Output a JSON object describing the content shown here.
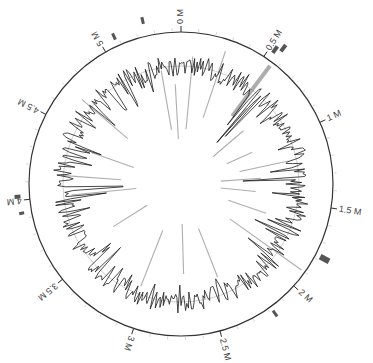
{
  "figure": {
    "type": "circular-genome-map",
    "genome_size_mb": 5.45,
    "center": [
      181,
      184
    ],
    "radius": 152,
    "colors": {
      "ring": "#333333",
      "trace": "#1a1a1a",
      "inner_lines": "#9a9a9a",
      "markers": "#555555",
      "highlight": "#999999"
    }
  },
  "axis": {
    "tick_labels": [
      {
        "pos": 0.0,
        "label": "0 M"
      },
      {
        "pos": 0.5,
        "label": "0.5 M"
      },
      {
        "pos": 1.0,
        "label": "1 M"
      },
      {
        "pos": 1.5,
        "label": "1.5 M"
      },
      {
        "pos": 2.0,
        "label": "2 M"
      },
      {
        "pos": 2.5,
        "label": "2.5 M"
      },
      {
        "pos": 3.0,
        "label": "3 M"
      },
      {
        "pos": 3.5,
        "label": "3.5 M"
      },
      {
        "pos": 4.0,
        "label": "4 M"
      },
      {
        "pos": 4.5,
        "label": "4.5 M"
      },
      {
        "pos": 5.0,
        "label": "5 M"
      }
    ],
    "minor_tick_step_mb": 0.1
  },
  "outer_markers": [
    {
      "pos": 0.53,
      "rOffset": 12,
      "size": [
        4,
        8
      ]
    },
    {
      "pos": 0.56,
      "rOffset": 18,
      "size": [
        4,
        8
      ]
    },
    {
      "pos": 1.78,
      "rOffset": 10,
      "size": [
        6,
        10
      ]
    },
    {
      "pos": 2.18,
      "rOffset": 8,
      "size": [
        3,
        7
      ]
    },
    {
      "pos": 3.93,
      "rOffset": 10,
      "size": [
        3,
        5
      ]
    },
    {
      "pos": 4.02,
      "rOffset": 12,
      "size": [
        4,
        6
      ]
    },
    {
      "pos": 5.08,
      "rOffset": 10,
      "size": [
        3,
        7
      ]
    },
    {
      "pos": 5.25,
      "rOffset": 16,
      "size": [
        3,
        7
      ]
    }
  ],
  "highlight_band": {
    "pos": 0.56,
    "r1": 85,
    "r2": 148,
    "width": 4
  },
  "inner_lines": [
    {
      "pos": 0.08,
      "r1": 55,
      "r2": 128
    },
    {
      "pos": 0.28,
      "r1": 70,
      "r2": 140
    },
    {
      "pos": 0.62,
      "r1": 55,
      "r2": 100
    },
    {
      "pos": 0.75,
      "r1": 42,
      "r2": 82
    },
    {
      "pos": 1.0,
      "r1": 50,
      "r2": 78
    },
    {
      "pos": 1.18,
      "r1": 60,
      "r2": 110
    },
    {
      "pos": 1.3,
      "r1": 40,
      "r2": 80
    },
    {
      "pos": 1.45,
      "r1": 40,
      "r2": 75
    },
    {
      "pos": 1.65,
      "r1": 50,
      "r2": 90
    },
    {
      "pos": 1.9,
      "r1": 60,
      "r2": 148
    },
    {
      "pos": 2.4,
      "r1": 48,
      "r2": 100
    },
    {
      "pos": 2.7,
      "r1": 40,
      "r2": 90
    },
    {
      "pos": 3.05,
      "r1": 50,
      "r2": 110
    },
    {
      "pos": 3.6,
      "r1": 40,
      "r2": 80
    },
    {
      "pos": 4.15,
      "r1": 60,
      "r2": 120
    },
    {
      "pos": 4.0,
      "r1": 45,
      "r2": 110
    },
    {
      "pos": 4.38,
      "r1": 50,
      "r2": 95
    },
    {
      "pos": 4.7,
      "r1": 70,
      "r2": 130
    },
    {
      "pos": 5.3,
      "r1": 55,
      "r2": 115
    },
    {
      "pos": 5.4,
      "r1": 45,
      "r2": 100
    }
  ],
  "trace": {
    "baseline_r": 118,
    "samples": 520,
    "spikes": [
      {
        "pos": 0.62,
        "r": 55
      },
      {
        "pos": 0.65,
        "r": 65
      },
      {
        "pos": 0.58,
        "r": 75
      },
      {
        "pos": 1.32,
        "r": 62
      },
      {
        "pos": 1.25,
        "r": 90
      },
      {
        "pos": 1.75,
        "r": 82
      },
      {
        "pos": 4.05,
        "r": 58
      },
      {
        "pos": 3.98,
        "r": 75
      },
      {
        "pos": 4.72,
        "r": 88
      },
      {
        "pos": 4.9,
        "r": 92
      },
      {
        "pos": 5.2,
        "r": 96
      }
    ]
  }
}
